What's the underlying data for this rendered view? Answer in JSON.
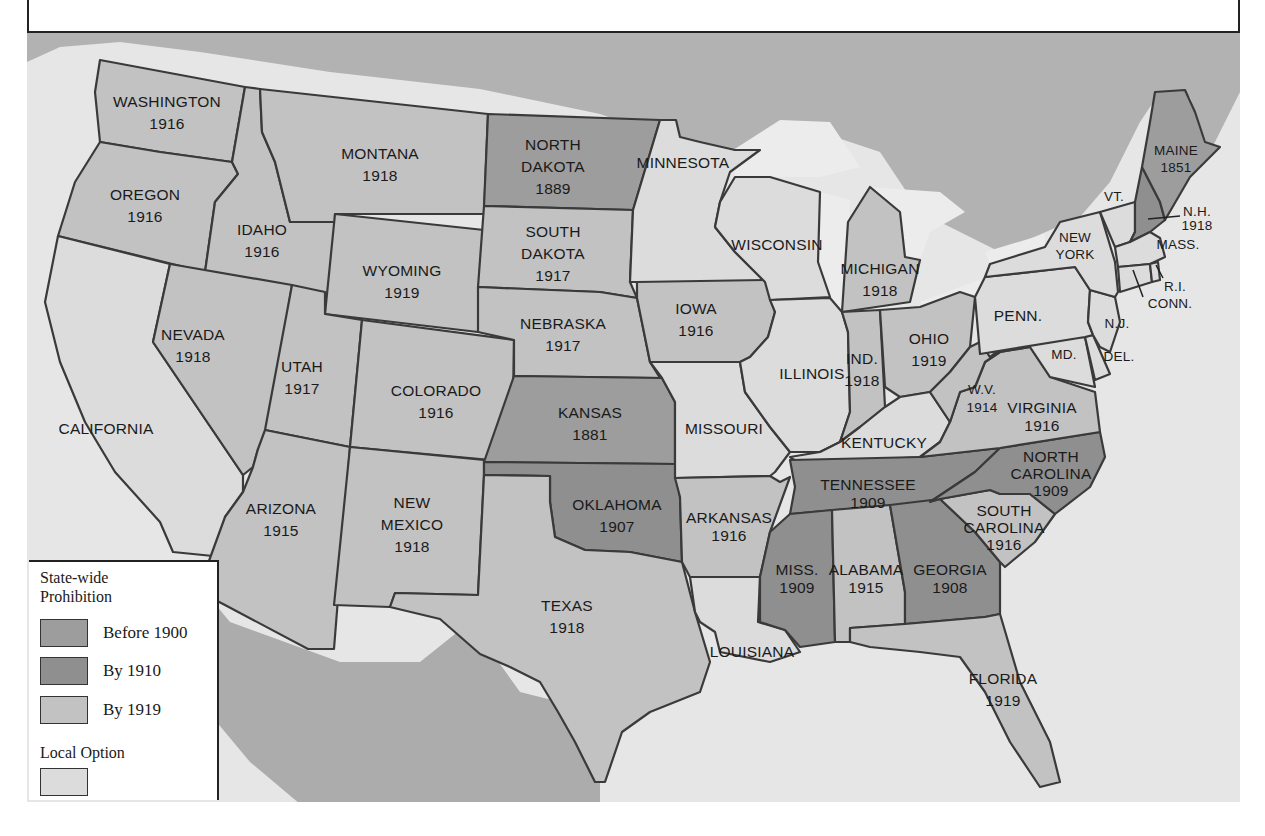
{
  "map": {
    "title": "State-wide Prohibition and Local Option",
    "colors": {
      "before_1900": "#9d9d9d",
      "by_1910": "#8f8f8f",
      "by_1919": "#c2c2c2",
      "local_option": "#dcdcdc",
      "canada": "#b2b2b2",
      "mexico": "#acacac",
      "water": "#ececec",
      "border": "#3a3a3a"
    },
    "states": [
      {
        "name": "WASHINGTON",
        "year": "1916",
        "category": "by_1919"
      },
      {
        "name": "OREGON",
        "year": "1916",
        "category": "by_1919"
      },
      {
        "name": "IDAHO",
        "year": "1916",
        "category": "by_1919"
      },
      {
        "name": "MONTANA",
        "year": "1918",
        "category": "by_1919"
      },
      {
        "name": "WYOMING",
        "year": "1919",
        "category": "by_1919"
      },
      {
        "name": "NEVADA",
        "year": "1918",
        "category": "by_1919"
      },
      {
        "name": "CALIFORNIA",
        "year": "",
        "category": "local_option"
      },
      {
        "name": "UTAH",
        "year": "1917",
        "category": "by_1919"
      },
      {
        "name": "COLORADO",
        "year": "1916",
        "category": "by_1919"
      },
      {
        "name": "ARIZONA",
        "year": "1915",
        "category": "by_1919"
      },
      {
        "name": "NEW MEXICO",
        "year": "1918",
        "category": "by_1919"
      },
      {
        "name": "NORTH DAKOTA",
        "year": "1889",
        "category": "before_1900"
      },
      {
        "name": "SOUTH DAKOTA",
        "year": "1917",
        "category": "by_1919"
      },
      {
        "name": "NEBRASKA",
        "year": "1917",
        "category": "by_1919"
      },
      {
        "name": "KANSAS",
        "year": "1881",
        "category": "before_1900"
      },
      {
        "name": "OKLAHOMA",
        "year": "1907",
        "category": "by_1910"
      },
      {
        "name": "TEXAS",
        "year": "1918",
        "category": "by_1919"
      },
      {
        "name": "MINNESOTA",
        "year": "",
        "category": "local_option"
      },
      {
        "name": "IOWA",
        "year": "1916",
        "category": "by_1919"
      },
      {
        "name": "MISSOURI",
        "year": "",
        "category": "local_option"
      },
      {
        "name": "ARKANSAS",
        "year": "1916",
        "category": "by_1919"
      },
      {
        "name": "LOUISIANA",
        "year": "",
        "category": "local_option"
      },
      {
        "name": "WISCONSIN",
        "year": "",
        "category": "local_option"
      },
      {
        "name": "ILLINOIS",
        "year": "",
        "category": "local_option"
      },
      {
        "name": "MICHIGAN",
        "year": "1918",
        "category": "by_1919"
      },
      {
        "name": "IND.",
        "year": "1918",
        "category": "by_1919"
      },
      {
        "name": "OHIO",
        "year": "1919",
        "category": "by_1919"
      },
      {
        "name": "KENTUCKY",
        "year": "",
        "category": "local_option"
      },
      {
        "name": "TENNESSEE",
        "year": "1909",
        "category": "by_1910"
      },
      {
        "name": "MISS.",
        "year": "1909",
        "category": "by_1910"
      },
      {
        "name": "ALABAMA",
        "year": "1915",
        "category": "by_1919"
      },
      {
        "name": "GEORGIA",
        "year": "1908",
        "category": "by_1910"
      },
      {
        "name": "FLORIDA",
        "year": "1919",
        "category": "by_1919"
      },
      {
        "name": "SOUTH CAROLINA",
        "year": "1916",
        "category": "by_1919"
      },
      {
        "name": "NORTH CAROLINA",
        "year": "1909",
        "category": "by_1910"
      },
      {
        "name": "VIRGINIA",
        "year": "1916",
        "category": "by_1919"
      },
      {
        "name": "W.V.",
        "year": "1914",
        "category": "by_1919"
      },
      {
        "name": "MD.",
        "year": "",
        "category": "local_option"
      },
      {
        "name": "DEL.",
        "year": "",
        "category": "local_option"
      },
      {
        "name": "PENN.",
        "year": "",
        "category": "local_option"
      },
      {
        "name": "N.J.",
        "year": "",
        "category": "local_option"
      },
      {
        "name": "NEW YORK",
        "year": "",
        "category": "local_option"
      },
      {
        "name": "VT.",
        "year": "",
        "category": "local_option"
      },
      {
        "name": "N.H.",
        "year": "1918",
        "category": "by_1919"
      },
      {
        "name": "MAINE",
        "year": "1851",
        "category": "before_1900"
      },
      {
        "name": "MASS.",
        "year": "",
        "category": "local_option"
      },
      {
        "name": "R.I.",
        "year": "",
        "category": "local_option"
      },
      {
        "name": "CONN.",
        "year": "",
        "category": "local_option"
      }
    ],
    "labels": {
      "wa": [
        "WASHINGTON",
        "1916"
      ],
      "or": [
        "OREGON",
        "1916"
      ],
      "id": [
        "IDAHO",
        "1916"
      ],
      "mt": [
        "MONTANA",
        "1918"
      ],
      "wy": [
        "WYOMING",
        "1919"
      ],
      "nv": [
        "NEVADA",
        "1918"
      ],
      "ca": [
        "CALIFORNIA"
      ],
      "ut": [
        "UTAH",
        "1917"
      ],
      "co": [
        "COLORADO",
        "1916"
      ],
      "az": [
        "ARIZONA",
        "1915"
      ],
      "nm": [
        "NEW",
        "MEXICO",
        "1918"
      ],
      "nd": [
        "NORTH",
        "DAKOTA",
        "1889"
      ],
      "sd": [
        "SOUTH",
        "DAKOTA",
        "1917"
      ],
      "ne": [
        "NEBRASKA",
        "1917"
      ],
      "ks": [
        "KANSAS",
        "1881"
      ],
      "ok": [
        "OKLAHOMA",
        "1907"
      ],
      "tx": [
        "TEXAS",
        "1918"
      ],
      "mn": [
        "MINNESOTA"
      ],
      "ia": [
        "IOWA",
        "1916"
      ],
      "mo": [
        "MISSOURI"
      ],
      "ar": [
        "ARKANSAS",
        "1916"
      ],
      "la": [
        "LOUISIANA"
      ],
      "wi": [
        "WISCONSIN"
      ],
      "il": [
        "ILLINOIS"
      ],
      "mi": [
        "MICHIGAN",
        "1918"
      ],
      "in": [
        "IND.",
        "1918"
      ],
      "oh": [
        "OHIO",
        "1919"
      ],
      "ky": [
        "KENTUCKY"
      ],
      "tn": [
        "TENNESSEE",
        "1909"
      ],
      "ms": [
        "MISS.",
        "1909"
      ],
      "al": [
        "ALABAMA",
        "1915"
      ],
      "ga": [
        "GEORGIA",
        "1908"
      ],
      "fl": [
        "FLORIDA",
        "1919"
      ],
      "sc": [
        "SOUTH",
        "CAROLINA",
        "1916"
      ],
      "nc": [
        "NORTH",
        "CAROLINA",
        "1909"
      ],
      "va": [
        "VIRGINIA",
        "1916"
      ],
      "wv": [
        "W.V.",
        "1914"
      ],
      "md": [
        "MD."
      ],
      "de": [
        "DEL."
      ],
      "pa": [
        "PENN."
      ],
      "nj": [
        "N.J."
      ],
      "ny": [
        "NEW",
        "YORK"
      ],
      "vt": [
        "VT."
      ],
      "nh": [
        "N.H.",
        "1918"
      ],
      "me": [
        "MAINE",
        "1851"
      ],
      "ma": [
        "MASS."
      ],
      "ri": [
        "R.I."
      ],
      "ct": [
        "CONN."
      ]
    }
  },
  "legend": {
    "title_line1": "State-wide",
    "title_line2": "Prohibition",
    "items": [
      {
        "label": "Before 1900",
        "color": "#9d9d9d"
      },
      {
        "label": "By 1910",
        "color": "#8f8f8f"
      },
      {
        "label": "By 1919",
        "color": "#c2c2c2"
      }
    ],
    "local_option_label": "Local Option",
    "local_option_color": "#dcdcdc"
  }
}
